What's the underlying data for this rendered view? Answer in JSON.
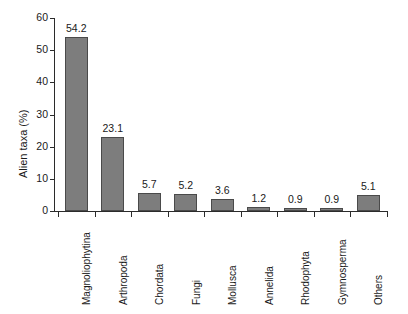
{
  "chart_data": {
    "type": "bar",
    "title": "",
    "subtitle": "",
    "xlabel": "",
    "ylabel": "Alien taxa (%)",
    "ylim": [
      0,
      60
    ],
    "yticks": [
      0,
      10,
      20,
      30,
      40,
      50,
      60
    ],
    "grid": false,
    "legend": null,
    "bar_color": "#7d7d7d",
    "bar_edge_color": "#4a4a4a",
    "axis_color": "#2b2b2b",
    "categories": [
      "Magnoliophytina",
      "Arthropoda",
      "Chordata",
      "Fungi",
      "Mollusca",
      "Annelida",
      "Rhodophyta",
      "Gymnosperma",
      "Others"
    ],
    "values": [
      54.2,
      23.1,
      5.7,
      5.2,
      3.6,
      1.2,
      0.9,
      0.9,
      5.1
    ],
    "value_labels": [
      "54.2",
      "23.1",
      "5.7",
      "5.2",
      "3.6",
      "1.2",
      "0.9",
      "0.9",
      "5.1"
    ],
    "ytick_labels": [
      "0",
      "10",
      "20",
      "30",
      "40",
      "50",
      "60"
    ]
  }
}
